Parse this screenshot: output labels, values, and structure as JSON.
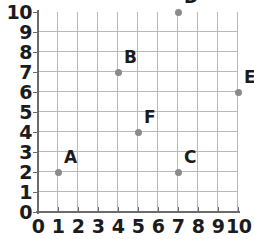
{
  "chart_data": {
    "type": "scatter",
    "title": "",
    "xlabel": "",
    "ylabel": "",
    "xlim": [
      0,
      10
    ],
    "ylim": [
      0,
      10
    ],
    "grid": true,
    "legend": "none",
    "x_ticks": [
      "0",
      "1",
      "2",
      "3",
      "4",
      "5",
      "6",
      "7",
      "8",
      "9",
      "10"
    ],
    "y_ticks": [
      "0",
      "1",
      "2",
      "3",
      "4",
      "5",
      "6",
      "7",
      "8",
      "9",
      "10"
    ],
    "point_color": "#8a8a8a",
    "grid_color": "#b9b9b9",
    "axis_color": "#6b6b6b",
    "label_color": "#1b1b1b",
    "points": [
      {
        "label": "A",
        "x": 1,
        "y": 2
      },
      {
        "label": "B",
        "x": 4,
        "y": 7
      },
      {
        "label": "C",
        "x": 7,
        "y": 2
      },
      {
        "label": "D",
        "x": 7,
        "y": 10
      },
      {
        "label": "E",
        "x": 10,
        "y": 6
      },
      {
        "label": "F",
        "x": 5,
        "y": 4
      }
    ]
  }
}
